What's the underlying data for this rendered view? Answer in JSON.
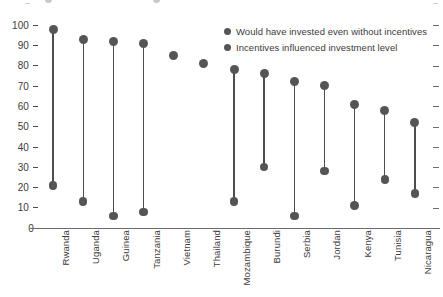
{
  "chart_data": {
    "type": "scatter",
    "title": "",
    "subtitle": "",
    "xlabel": "",
    "ylabel": "",
    "ylim": [
      0,
      100
    ],
    "yticks": [
      0,
      10,
      20,
      30,
      40,
      50,
      60,
      70,
      80,
      90,
      100
    ],
    "grid": false,
    "legend_position": "top-right",
    "categories": [
      "Rwanda",
      "Uganda",
      "Guinea",
      "Tanzania",
      "Vietnam",
      "Thailand",
      "Mozambique",
      "Burundi",
      "Serbia",
      "Jordan",
      "Kenya",
      "Tunisia",
      "Nicaragua"
    ],
    "series": [
      {
        "name": "Would have invested even without incentives",
        "color": "#555555",
        "values": [
          98,
          93,
          92,
          91,
          85,
          81,
          78,
          76,
          72,
          70,
          61,
          58,
          52
        ]
      },
      {
        "name": "Incentives influenced investment level",
        "color": "#555555",
        "values": [
          21,
          13,
          6,
          8,
          null,
          null,
          13,
          30,
          6,
          28,
          11,
          24,
          17
        ]
      }
    ]
  },
  "legend": {
    "items": [
      {
        "label": "Would have invested even without incentives",
        "color": "#555555"
      },
      {
        "label": "Incentives influenced investment level",
        "color": "#555555"
      }
    ]
  },
  "axis": {
    "y_tick_labels": [
      "100",
      "90",
      "80",
      "70",
      "60",
      "50",
      "40",
      "30",
      "20",
      "10",
      "0"
    ],
    "x_tick_labels": [
      "Rwanda",
      "Uganda",
      "Guinea",
      "Tanzania",
      "Vietnam",
      "Thailand",
      "Mozambique",
      "Burundi",
      "Serbia",
      "Jordan",
      "Kenya",
      "Tunisia",
      "Nicaragua"
    ]
  },
  "colors": {
    "marker": "#555555",
    "connector": "#4d4d4d",
    "axis": "#6b6b6b",
    "text": "#3b3b3b",
    "background": "#ffffff"
  }
}
